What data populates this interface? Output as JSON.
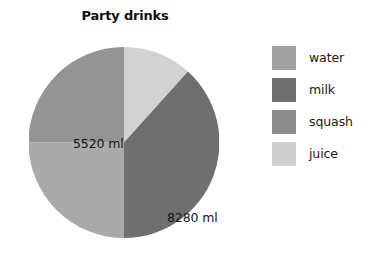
{
  "chart_data": {
    "type": "pie",
    "title": "Party drinks",
    "categories": [
      "water",
      "milk",
      "squash",
      "juice"
    ],
    "values": [
      null,
      8280,
      5520,
      null
    ],
    "value_unit": "ml",
    "slices": [
      {
        "name": "juice",
        "label": "",
        "color": "#d2d2d2",
        "start_deg": 0,
        "end_deg": 42
      },
      {
        "name": "milk",
        "label": "8280 ml",
        "color": "#6f6f6f",
        "start_deg": 42,
        "end_deg": 180
      },
      {
        "name": "water",
        "label": "",
        "color": "#aaaaaa",
        "start_deg": 180,
        "end_deg": 270
      },
      {
        "name": "squash",
        "label": "5520 ml",
        "color": "#949494",
        "start_deg": 270,
        "end_deg": 360
      }
    ],
    "visible_labels": [
      "5520 ml",
      "8280 ml"
    ],
    "legend": {
      "position": "right",
      "entries": [
        {
          "label": "water",
          "color": "#a2a2a2"
        },
        {
          "label": "milk",
          "color": "#6f6f6f"
        },
        {
          "label": "squash",
          "color": "#8b8b8b"
        },
        {
          "label": "juice",
          "color": "#cfcfcf"
        }
      ]
    },
    "grid": false,
    "xlabel": "",
    "ylabel": ""
  },
  "pie": {
    "label_squash": "5520 ml",
    "label_milk": "8280 ml"
  },
  "legend": {
    "item0": "water",
    "item1": "milk",
    "item2": "squash",
    "item3": "juice"
  },
  "title": "Party drinks"
}
